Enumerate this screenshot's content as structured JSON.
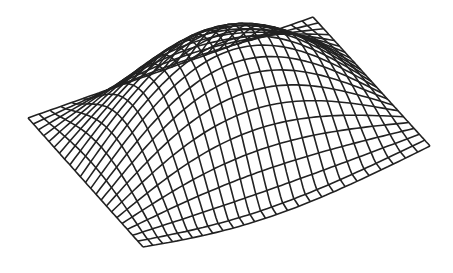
{
  "figure": {
    "background": "#ffffff",
    "line_color": "#222222",
    "line_width": 1.6,
    "grid": {
      "u_lines": 26,
      "v_lines": 22
    },
    "corners": {
      "left": [
        28,
        118
      ],
      "top_right": [
        313,
        17
      ],
      "right": [
        430,
        146
      ],
      "bottom": [
        143,
        247
      ]
    }
  }
}
